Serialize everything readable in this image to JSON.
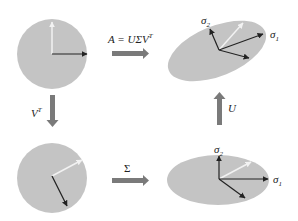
{
  "diagram": {
    "colors": {
      "shape_fill": "#c4c4c4",
      "arrow_gray": "#7a7a7a",
      "vector_dark": "#222222",
      "vector_white": "#f2f2f2"
    },
    "nodes": [
      {
        "id": "unit-circle",
        "shape": "circle",
        "position": "top-left"
      },
      {
        "id": "rotated-circle",
        "shape": "circle",
        "position": "bottom-left"
      },
      {
        "id": "scaled-ellipse",
        "shape": "ellipse",
        "position": "bottom-right",
        "axes": [
          "σ1",
          "σ2"
        ]
      },
      {
        "id": "final-ellipse",
        "shape": "rotated-ellipse",
        "position": "top-right",
        "axes": [
          "σ1",
          "σ2"
        ]
      }
    ],
    "edges": [
      {
        "from": "unit-circle",
        "to": "final-ellipse",
        "label": "A = UΣV",
        "sup": "T"
      },
      {
        "from": "unit-circle",
        "to": "rotated-circle",
        "label": "V",
        "sup": "T"
      },
      {
        "from": "rotated-circle",
        "to": "scaled-ellipse",
        "label": "Σ"
      },
      {
        "from": "scaled-ellipse",
        "to": "final-ellipse",
        "label": "U"
      }
    ],
    "labels": {
      "top_arrow": "A = UΣV",
      "top_arrow_sup": "T",
      "left_arrow": "V",
      "left_arrow_sup": "T",
      "bottom_arrow": "Σ",
      "right_arrow": "U",
      "sigma1_main": "σ",
      "sigma1_sub": "1",
      "sigma2_main": "σ",
      "sigma2_sub": "2"
    }
  }
}
